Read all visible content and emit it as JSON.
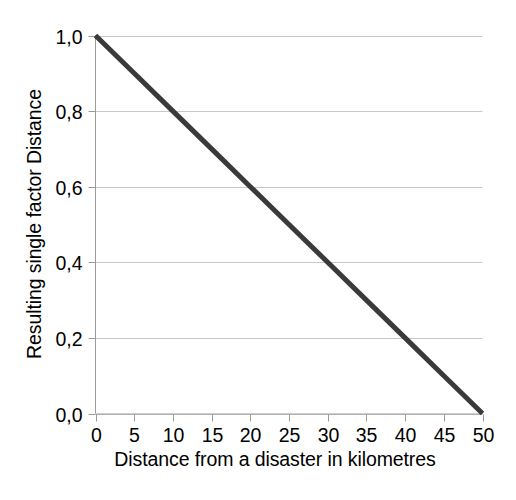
{
  "chart_data": {
    "type": "line",
    "title": "",
    "subtitle": "",
    "xlabel": "Distance from a disaster in kilometres",
    "ylabel": "Resulting single factor Distance",
    "x": [
      0,
      5,
      10,
      15,
      20,
      25,
      30,
      35,
      40,
      45,
      50
    ],
    "series": [
      {
        "name": "Resulting single factor Distance",
        "values": [
          1.0,
          0.9,
          0.8,
          0.7,
          0.6,
          0.5,
          0.4,
          0.3,
          0.2,
          0.1,
          0.0
        ],
        "color": "#3a3a3a"
      }
    ],
    "xlim": [
      0,
      50
    ],
    "ylim": [
      0.0,
      1.0
    ],
    "xticks": [
      0,
      5,
      10,
      15,
      20,
      25,
      30,
      35,
      40,
      45,
      50
    ],
    "yticks": [
      0.0,
      0.2,
      0.4,
      0.6,
      0.8,
      1.0
    ],
    "xtick_labels": [
      "0",
      "5",
      "10",
      "15",
      "20",
      "25",
      "30",
      "35",
      "40",
      "45",
      "50"
    ],
    "ytick_labels": [
      "0,0",
      "0,2",
      "0,4",
      "0,6",
      "0,8",
      "1,0"
    ],
    "decimal_separator": ",",
    "grid": {
      "horizontal": true,
      "vertical": false,
      "color": "#c8c8c8"
    },
    "legend": {
      "visible": false,
      "position": "none",
      "entries": []
    },
    "axis_color": "#9a9a9a",
    "tick_color": "#9a9a9a",
    "background": "#ffffff",
    "annotations": []
  }
}
